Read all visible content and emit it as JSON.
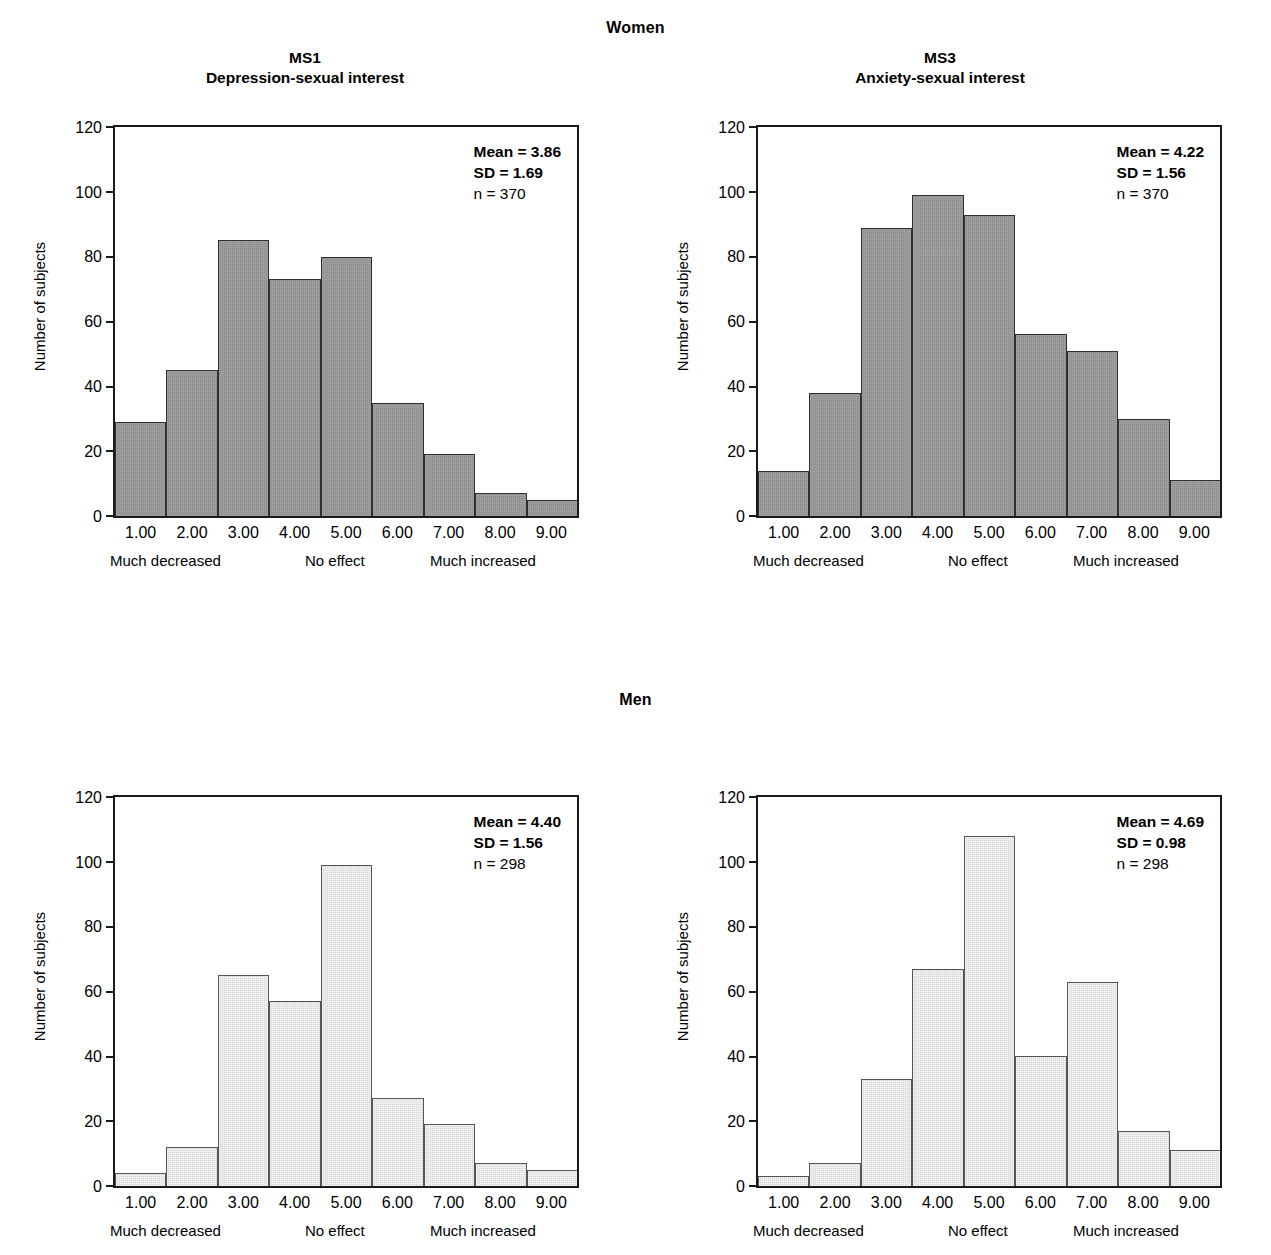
{
  "groups": [
    {
      "label": "Women"
    },
    {
      "label": "Men"
    }
  ],
  "axis": {
    "ylabel": "Number of subjects",
    "yticks": [
      "0",
      "20",
      "40",
      "60",
      "80",
      "100",
      "120"
    ],
    "xticks": [
      "1.00",
      "2.00",
      "3.00",
      "4.00",
      "5.00",
      "6.00",
      "7.00",
      "8.00",
      "9.00"
    ],
    "anchors": {
      "low": "Much decreased",
      "mid": "No effect",
      "high": "Much increased"
    }
  },
  "colors": {
    "women_bar": "#8d8d8d",
    "men_bar": "#d9d9d9",
    "axis": "#1a1a1a",
    "text": "#000000"
  },
  "panels": [
    {
      "code": "MS1",
      "title": "Depression-sexual interest",
      "group": "Women",
      "stats": {
        "mean": "Mean = 3.86",
        "sd": "SD = 1.69",
        "n": "n = 370"
      }
    },
    {
      "code": "MS3",
      "title": "Anxiety-sexual interest",
      "group": "Women",
      "stats": {
        "mean": "Mean = 4.22",
        "sd": "SD = 1.56",
        "n": "n = 370"
      }
    },
    {
      "code": "MS1",
      "title": "Depression-sexual interest",
      "group": "Men",
      "stats": {
        "mean": "Mean = 4.40",
        "sd": "SD = 1.56",
        "n": "n = 298"
      }
    },
    {
      "code": "MS3",
      "title": "Anxiety-sexual interest",
      "group": "Men",
      "stats": {
        "mean": "Mean = 4.69",
        "sd": "SD = 0.98",
        "n": "n = 298"
      }
    }
  ],
  "chart_data": [
    {
      "type": "bar",
      "title": "MS1 Depression-sexual interest (Women)",
      "group": "Women",
      "categories": [
        "1.00",
        "2.00",
        "3.00",
        "4.00",
        "5.00",
        "6.00",
        "7.00",
        "8.00",
        "9.00"
      ],
      "values": [
        29,
        45,
        85,
        73,
        80,
        35,
        19,
        7,
        5
      ],
      "xlabel": "",
      "ylabel": "Number of subjects",
      "ylim": [
        0,
        120
      ],
      "yticks": [
        0,
        20,
        40,
        60,
        80,
        100,
        120
      ],
      "grid": false,
      "legend": "none",
      "annotations": [
        "Mean = 3.86",
        "SD = 1.69",
        "n = 370"
      ],
      "mean": 3.86,
      "sd": 1.69,
      "n": 370,
      "bar_color": "#8d8d8d"
    },
    {
      "type": "bar",
      "title": "MS3 Anxiety-sexual interest (Women)",
      "group": "Women",
      "categories": [
        "1.00",
        "2.00",
        "3.00",
        "4.00",
        "5.00",
        "6.00",
        "7.00",
        "8.00",
        "9.00"
      ],
      "values": [
        14,
        38,
        89,
        99,
        93,
        56,
        51,
        30,
        11
      ],
      "xlabel": "",
      "ylabel": "Number of subjects",
      "ylim": [
        0,
        120
      ],
      "yticks": [
        0,
        20,
        40,
        60,
        80,
        100,
        120
      ],
      "grid": false,
      "legend": "none",
      "annotations": [
        "Mean = 4.22",
        "SD = 1.56",
        "n = 370"
      ],
      "mean": 4.22,
      "sd": 1.56,
      "n": 370,
      "bar_color": "#8d8d8d"
    },
    {
      "type": "bar",
      "title": "MS1 Depression-sexual interest (Men)",
      "group": "Men",
      "categories": [
        "1.00",
        "2.00",
        "3.00",
        "4.00",
        "5.00",
        "6.00",
        "7.00",
        "8.00",
        "9.00"
      ],
      "values": [
        4,
        12,
        65,
        57,
        99,
        27,
        19,
        7,
        5
      ],
      "xlabel": "",
      "ylabel": "Number of subjects",
      "ylim": [
        0,
        120
      ],
      "yticks": [
        0,
        20,
        40,
        60,
        80,
        100,
        120
      ],
      "grid": false,
      "legend": "none",
      "annotations": [
        "Mean = 4.40",
        "SD = 1.56",
        "n = 298"
      ],
      "mean": 4.4,
      "sd": 1.56,
      "n": 298,
      "bar_color": "#d9d9d9"
    },
    {
      "type": "bar",
      "title": "MS3 Anxiety-sexual interest (Men)",
      "group": "Men",
      "categories": [
        "1.00",
        "2.00",
        "3.00",
        "4.00",
        "5.00",
        "6.00",
        "7.00",
        "8.00",
        "9.00"
      ],
      "values": [
        3,
        7,
        33,
        67,
        108,
        40,
        63,
        17,
        11
      ],
      "xlabel": "",
      "ylabel": "Number of subjects",
      "ylim": [
        0,
        120
      ],
      "yticks": [
        0,
        20,
        40,
        60,
        80,
        100,
        120
      ],
      "grid": false,
      "legend": "none",
      "annotations": [
        "Mean = 4.69",
        "SD = 0.98",
        "n = 298"
      ],
      "mean": 4.69,
      "sd": 0.98,
      "n": 298,
      "bar_color": "#d9d9d9"
    }
  ]
}
